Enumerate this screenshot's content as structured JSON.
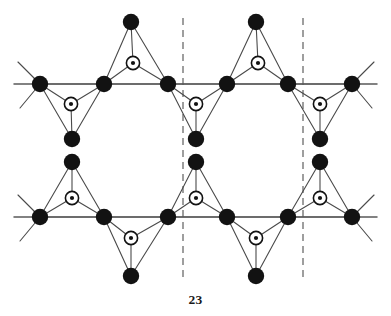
{
  "figure": {
    "caption_number": "23",
    "kind": "crystal-lattice-diagram",
    "width": 391,
    "height": 316,
    "background_color": "#ffffff"
  },
  "style": {
    "vertex_color": "#121212",
    "center_ring_fill": "#ffffff",
    "center_ring_stroke": "#121212",
    "center_dot_color": "#121212",
    "bond_color": "#4a4a4a",
    "axis_color": "#5a5a5a",
    "dashed_color": "#6b6b6b",
    "vertex_radius": 8.2,
    "center_ring_radius": 6.6,
    "center_dot_radius": 2.1
  },
  "rows": {
    "top_axis_y": 84,
    "bottom_axis_y": 217
  },
  "axis_lines": [
    {
      "name": "top-axis",
      "x1": 14,
      "y1": 84,
      "x2": 377,
      "y2": 84
    },
    {
      "name": "bottom-axis",
      "x1": 14,
      "y1": 217,
      "x2": 377,
      "y2": 217
    }
  ],
  "dashed_lines": [
    {
      "name": "unit-cell-boundary-left",
      "x": 183,
      "y1": 18,
      "y2": 282
    },
    {
      "name": "unit-cell-boundary-right",
      "x": 303,
      "y1": 18,
      "y2": 282
    }
  ],
  "vertex_nodes": [
    {
      "id": "t-row-0",
      "x": 40,
      "y": 84
    },
    {
      "id": "t-row-1",
      "x": 104,
      "y": 84
    },
    {
      "id": "t-row-2",
      "x": 168,
      "y": 84
    },
    {
      "id": "t-row-3",
      "x": 227,
      "y": 84
    },
    {
      "id": "t-row-4",
      "x": 288,
      "y": 84
    },
    {
      "id": "t-row-5",
      "x": 352,
      "y": 84
    },
    {
      "id": "t-apex-a",
      "x": 131,
      "y": 22
    },
    {
      "id": "t-apex-b",
      "x": 256,
      "y": 22
    },
    {
      "id": "t-low-a",
      "x": 72,
      "y": 139
    },
    {
      "id": "t-low-b",
      "x": 196,
      "y": 139
    },
    {
      "id": "t-low-c",
      "x": 320,
      "y": 139
    },
    {
      "id": "b-row-0",
      "x": 40,
      "y": 217
    },
    {
      "id": "b-row-1",
      "x": 104,
      "y": 217
    },
    {
      "id": "b-row-2",
      "x": 168,
      "y": 217
    },
    {
      "id": "b-row-3",
      "x": 227,
      "y": 217
    },
    {
      "id": "b-row-4",
      "x": 288,
      "y": 217
    },
    {
      "id": "b-row-5",
      "x": 352,
      "y": 217
    },
    {
      "id": "b-apex-a",
      "x": 72,
      "y": 162
    },
    {
      "id": "b-apex-b",
      "x": 196,
      "y": 162
    },
    {
      "id": "b-apex-c",
      "x": 320,
      "y": 162
    },
    {
      "id": "b-low-a",
      "x": 131,
      "y": 276
    },
    {
      "id": "b-low-b",
      "x": 256,
      "y": 276
    }
  ],
  "center_nodes": [
    {
      "id": "c-top-up-a",
      "x": 133,
      "y": 63
    },
    {
      "id": "c-top-up-b",
      "x": 258,
      "y": 63
    },
    {
      "id": "c-top-dn-a",
      "x": 71,
      "y": 104
    },
    {
      "id": "c-top-dn-b",
      "x": 196,
      "y": 104
    },
    {
      "id": "c-top-dn-c",
      "x": 320,
      "y": 104
    },
    {
      "id": "c-bot-up-a",
      "x": 72,
      "y": 198
    },
    {
      "id": "c-bot-up-b",
      "x": 196,
      "y": 198
    },
    {
      "id": "c-bot-up-c",
      "x": 320,
      "y": 198
    },
    {
      "id": "c-bot-dn-a",
      "x": 131,
      "y": 238
    },
    {
      "id": "c-bot-dn-b",
      "x": 256,
      "y": 238
    }
  ],
  "triangles": [
    {
      "id": "tri-top-up-a",
      "orientation": "up",
      "vertices": [
        "t-row-1",
        "t-row-2",
        "t-apex-a"
      ],
      "center": "c-top-up-a"
    },
    {
      "id": "tri-top-up-b",
      "orientation": "up",
      "vertices": [
        "t-row-3",
        "t-row-4",
        "t-apex-b"
      ],
      "center": "c-top-up-b"
    },
    {
      "id": "tri-top-dn-a",
      "orientation": "down",
      "vertices": [
        "t-row-0",
        "t-row-1",
        "t-low-a"
      ],
      "center": "c-top-dn-a"
    },
    {
      "id": "tri-top-dn-b",
      "orientation": "down",
      "vertices": [
        "t-row-2",
        "t-row-3",
        "t-low-b"
      ],
      "center": "c-top-dn-b"
    },
    {
      "id": "tri-top-dn-c",
      "orientation": "down",
      "vertices": [
        "t-row-4",
        "t-row-5",
        "t-low-c"
      ],
      "center": "c-top-dn-c"
    },
    {
      "id": "tri-bot-up-a",
      "orientation": "up",
      "vertices": [
        "b-row-0",
        "b-row-1",
        "b-apex-a"
      ],
      "center": "c-bot-up-a"
    },
    {
      "id": "tri-bot-up-b",
      "orientation": "up",
      "vertices": [
        "b-row-2",
        "b-row-3",
        "b-apex-b"
      ],
      "center": "c-bot-up-b"
    },
    {
      "id": "tri-bot-up-c",
      "orientation": "up",
      "vertices": [
        "b-row-4",
        "b-row-5",
        "b-apex-c"
      ],
      "center": "c-bot-up-c"
    },
    {
      "id": "tri-bot-dn-a",
      "orientation": "down",
      "vertices": [
        "b-row-1",
        "b-row-2",
        "b-low-a"
      ],
      "center": "c-bot-dn-a"
    },
    {
      "id": "tri-bot-dn-b",
      "orientation": "down",
      "vertices": [
        "b-row-3",
        "b-row-4",
        "b-low-b"
      ],
      "center": "c-bot-dn-b"
    }
  ],
  "edge_stubs": [
    {
      "id": "stub-tl-up",
      "x1": 40,
      "y1": 84,
      "x2": 18,
      "y2": 62
    },
    {
      "id": "stub-tl-dn",
      "x1": 40,
      "y1": 84,
      "x2": 20,
      "y2": 108
    },
    {
      "id": "stub-tr-up",
      "x1": 352,
      "y1": 84,
      "x2": 374,
      "y2": 62
    },
    {
      "id": "stub-tr-dn",
      "x1": 352,
      "y1": 84,
      "x2": 372,
      "y2": 108
    },
    {
      "id": "stub-bl-dn",
      "x1": 40,
      "y1": 217,
      "x2": 20,
      "y2": 241
    },
    {
      "id": "stub-bl-up",
      "x1": 40,
      "y1": 217,
      "x2": 18,
      "y2": 195
    },
    {
      "id": "stub-br-dn",
      "x1": 352,
      "y1": 217,
      "x2": 372,
      "y2": 241
    },
    {
      "id": "stub-br-up",
      "x1": 352,
      "y1": 217,
      "x2": 374,
      "y2": 195
    }
  ]
}
